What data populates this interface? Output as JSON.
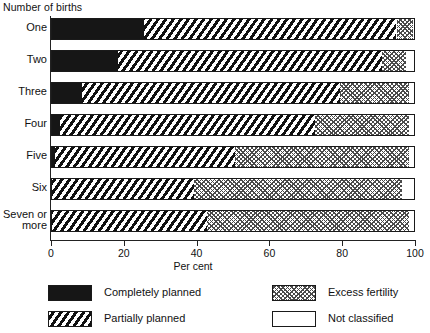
{
  "chart_data": {
    "type": "bar",
    "orientation": "horizontal",
    "stacked": true,
    "stack_mode": "percent",
    "title": "",
    "ylabel": "Number of births",
    "xlabel": "Per cent",
    "xlim": [
      0,
      100
    ],
    "xticks": [
      0,
      20,
      40,
      60,
      80,
      100
    ],
    "xtick_labels": [
      "0",
      "20",
      "40",
      "60",
      "80",
      "100"
    ],
    "grid": false,
    "legend_position": "bottom",
    "categories": [
      "One",
      "Two",
      "Three",
      "Four",
      "Five",
      "Six",
      "Seven  or\nmore"
    ],
    "series": [
      {
        "name": "Completely planned",
        "key": "completely",
        "values": [
          25.5,
          18.5,
          8.5,
          2.5,
          1.2,
          0,
          0
        ]
      },
      {
        "name": "Partially planned",
        "key": "partially",
        "values": [
          69.5,
          72.5,
          71.0,
          70.0,
          49.3,
          39.5,
          43.0
        ]
      },
      {
        "name": "Excess fertility",
        "key": "excess",
        "values": [
          4.5,
          6.5,
          19.0,
          26.0,
          48.0,
          57.0,
          55.5
        ]
      },
      {
        "name": "Not classified",
        "key": "notclass",
        "values": [
          0.5,
          2.5,
          1.5,
          1.5,
          1.5,
          3.5,
          1.5
        ]
      }
    ]
  },
  "legend": {
    "items": [
      {
        "label": "Completely planned",
        "key": "completely"
      },
      {
        "label": "Excess fertility",
        "key": "excess"
      },
      {
        "label": "Partially planned",
        "key": "partially"
      },
      {
        "label": "Not classified",
        "key": "notclass"
      }
    ]
  },
  "colors": {
    "ink": "#161616",
    "frame": "#1a1a1a",
    "paper": "#ffffff",
    "hatch": "#4a4a4a"
  }
}
